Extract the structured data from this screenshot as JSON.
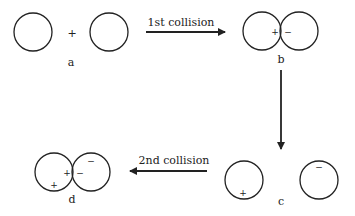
{
  "panels": {
    "a": {
      "label": "a",
      "plus": "+"
    },
    "b": {
      "label": "b",
      "left_charge": "+",
      "right_charge": "−"
    },
    "c": {
      "label": "c",
      "left_charge": "+",
      "right_charge": "−"
    },
    "d": {
      "label": "d",
      "left_charges": [
        "+",
        "+"
      ],
      "right_charges": [
        "−",
        "−"
      ]
    }
  },
  "arrows": {
    "first": {
      "label": "1st collision"
    },
    "second": {
      "label": "2nd collision"
    }
  },
  "colors": {
    "stroke": "#222222"
  }
}
